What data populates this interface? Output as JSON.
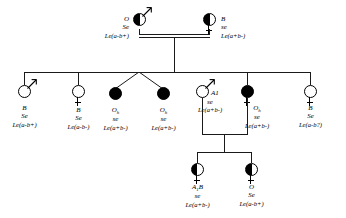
{
  "diagram": {
    "type": "pedigree"
  },
  "generation1": {
    "father": {
      "symbol": "half-filled-circle-male",
      "sex": "male",
      "fill": "half",
      "abo": "O",
      "secretor": "Se",
      "lewis": "Le(a-b+)"
    },
    "mother": {
      "symbol": "half-filled-circle-female",
      "sex": "female",
      "fill": "half",
      "abo": "B",
      "secretor": "se",
      "lewis": "Le(a+b-)"
    },
    "mating_line": "consanguineous-double-line"
  },
  "generation2": [
    {
      "symbol": "open-circle-male",
      "sex": "male",
      "fill": "open",
      "abo": "B",
      "secretor": "Se",
      "lewis": "Le(a-b+)"
    },
    {
      "symbol": "open-circle-female",
      "sex": "female",
      "fill": "open",
      "abo": "B",
      "secretor": "Se",
      "lewis": "Le(a-b-)"
    },
    {
      "symbol": "filled-circle",
      "sex": "unspecified",
      "fill": "filled",
      "abo": "Oh",
      "secretor": "se",
      "lewis": "Le(a+b-)"
    },
    {
      "symbol": "filled-circle",
      "sex": "unspecified",
      "fill": "filled",
      "abo": "Oh",
      "secretor": "se",
      "lewis": "Le(a+b-)"
    },
    {
      "symbol": "open-circle-male",
      "sex": "male",
      "fill": "open",
      "abo": "A1",
      "secretor": "se",
      "lewis": "Le(a+b-)"
    },
    {
      "symbol": "filled-circle-female",
      "sex": "female",
      "fill": "filled",
      "abo": "Oh",
      "secretor": "se",
      "lewis": "Le(a+b-)"
    },
    {
      "symbol": "open-circle-female",
      "sex": "female",
      "fill": "open",
      "abo": "B",
      "secretor": "Se",
      "lewis": "Le(a-b?)"
    }
  ],
  "generation3": [
    {
      "symbol": "half-filled-circle-female",
      "sex": "female",
      "fill": "half",
      "abo": "A1B",
      "secretor": "se",
      "lewis": "Le(a+b-)"
    },
    {
      "symbol": "half-filled-circle-female",
      "sex": "female",
      "fill": "half",
      "abo": "O",
      "secretor": "Se",
      "lewis": "Le(a-b+)"
    }
  ]
}
